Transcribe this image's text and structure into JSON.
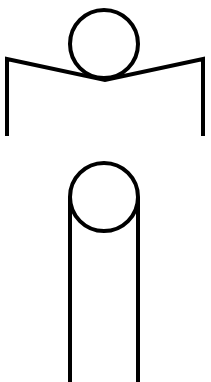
{
  "diagram": {
    "stroke_color": "#000000",
    "background_color": "#ffffff",
    "stroke_width": 4,
    "upper_figure": {
      "head": {
        "cx": 104,
        "cy": 44,
        "r": 34
      },
      "arms": {
        "left_top": [
          7,
          59
        ],
        "center": [
          105,
          80
        ],
        "right_top": [
          203,
          59
        ]
      },
      "left_leg": {
        "x": 7,
        "y1": 59,
        "y2": 136
      },
      "right_leg": {
        "x": 203,
        "y1": 59,
        "y2": 136
      }
    },
    "lower_figure": {
      "head": {
        "cx": 104,
        "cy": 197,
        "r": 34
      },
      "left_line": {
        "x": 70,
        "y1": 197,
        "y2": 382
      },
      "right_line": {
        "x": 138,
        "y1": 197,
        "y2": 382
      }
    }
  }
}
